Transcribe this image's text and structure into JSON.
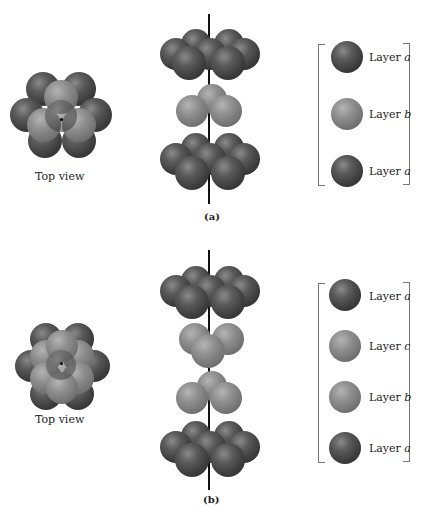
{
  "panel_a": {
    "caption": "(a)",
    "top_view_label": "Top view",
    "legend": [
      {
        "layer": "Layer ",
        "letter": "a",
        "shade": "dark"
      },
      {
        "layer": "Layer ",
        "letter": "b",
        "shade": "light"
      },
      {
        "layer": "Layer ",
        "letter": "a",
        "shade": "dark"
      }
    ]
  },
  "panel_b": {
    "caption": "(b)",
    "top_view_label": "Top view",
    "legend": [
      {
        "layer": "Layer ",
        "letter": "a",
        "shade": "dark"
      },
      {
        "layer": "Layer ",
        "letter": "c",
        "shade": "light"
      },
      {
        "layer": "Layer ",
        "letter": "b",
        "shade": "light"
      },
      {
        "layer": "Layer ",
        "letter": "a",
        "shade": "dark"
      }
    ]
  },
  "colors": {
    "dark_sphere": "#3c3c3c",
    "light_sphere": "#8e8e8e",
    "axis": "#111111"
  }
}
